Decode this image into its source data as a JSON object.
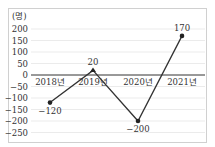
{
  "chart_data": {
    "type": "line",
    "title": "",
    "unit_label": "(명)",
    "xlabel": "",
    "ylabel": "(명)",
    "categories": [
      "2018년",
      "2019년",
      "2020년",
      "2021년"
    ],
    "series": [
      {
        "name": "",
        "values": [
          -120,
          20,
          -200,
          170
        ]
      }
    ],
    "data_labels": [
      "−120",
      "20",
      "−200",
      "170"
    ],
    "yticks": [
      200,
      150,
      100,
      50,
      0,
      -50,
      -100,
      -150,
      -200,
      -250
    ],
    "ytick_labels": [
      "200",
      "150",
      "100",
      "50",
      "0",
      "−50",
      "−100",
      "−150",
      "−200",
      "−250"
    ],
    "ylim": [
      -250,
      200
    ],
    "grid": true,
    "legend": "none",
    "colors": {
      "line": "#333333",
      "grid": "#e6e6e6",
      "frame": "#d0d0d0"
    }
  }
}
